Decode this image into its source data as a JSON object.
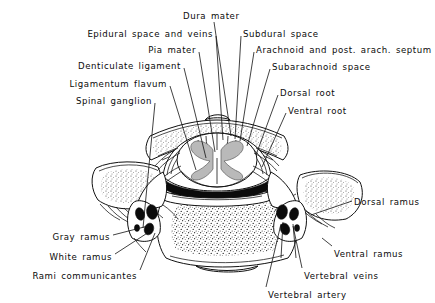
{
  "figure": {
    "style": "line-drawing",
    "ink_color": "#111111",
    "background_color": "#ffffff"
  },
  "labels": [
    {
      "id": "dura-mater",
      "text": "Dura mater",
      "align": "left",
      "x": 183,
      "y": 11,
      "leader": [
        [
          214,
          22
        ],
        [
          231,
          136
        ]
      ]
    },
    {
      "id": "epidural-space",
      "text": "Epidural space and veins",
      "align": "right",
      "x": 213,
      "y": 29,
      "leader": [
        [
          216,
          36
        ],
        [
          223,
          140
        ]
      ]
    },
    {
      "id": "pia-mater",
      "text": "Pia mater",
      "align": "right",
      "x": 196,
      "y": 45,
      "leader": [
        [
          199,
          52
        ],
        [
          215,
          152
        ]
      ]
    },
    {
      "id": "denticulate",
      "text": "Denticulate ligament",
      "align": "right",
      "x": 181,
      "y": 61,
      "leader": [
        [
          184,
          68
        ],
        [
          206,
          158
        ]
      ]
    },
    {
      "id": "ligamentum-flavum",
      "text": "Ligamentum flavum",
      "align": "right",
      "x": 167,
      "y": 79,
      "leader": [
        [
          170,
          86
        ],
        [
          196,
          170
        ]
      ]
    },
    {
      "id": "spinal-ganglion",
      "text": "Spinal ganglion",
      "align": "right",
      "x": 152,
      "y": 96,
      "leader": [
        [
          155,
          103
        ],
        [
          143,
          228
        ]
      ]
    },
    {
      "id": "subdural-space",
      "text": "Subdural space",
      "align": "left",
      "x": 243,
      "y": 29,
      "leader": [
        [
          241,
          36
        ],
        [
          235,
          139
        ]
      ]
    },
    {
      "id": "arachnoid",
      "text": "Arachnoid and post. arach. septum",
      "align": "left",
      "x": 256,
      "y": 45,
      "leader": [
        [
          254,
          52
        ],
        [
          240,
          141
        ]
      ]
    },
    {
      "id": "subarachnoid",
      "text": "Subarachnoid space",
      "align": "left",
      "x": 272,
      "y": 62,
      "leader": [
        [
          270,
          69
        ],
        [
          247,
          146
        ]
      ]
    },
    {
      "id": "dorsal-root",
      "text": "Dorsal root",
      "align": "left",
      "x": 280,
      "y": 88,
      "leader": [
        [
          278,
          95
        ],
        [
          256,
          155
        ]
      ]
    },
    {
      "id": "ventral-root",
      "text": "Ventral root",
      "align": "left",
      "x": 288,
      "y": 106,
      "leader": [
        [
          286,
          113
        ],
        [
          262,
          167
        ]
      ]
    },
    {
      "id": "dorsal-ramus",
      "text": "Dorsal ramus",
      "align": "left",
      "x": 354,
      "y": 197,
      "leader": [
        [
          352,
          201
        ],
        [
          311,
          215
        ]
      ]
    },
    {
      "id": "ventral-ramus",
      "text": "Ventral ramus",
      "align": "left",
      "x": 334,
      "y": 249,
      "leader": [
        [
          332,
          246
        ],
        [
          322,
          238
        ]
      ]
    },
    {
      "id": "vertebral-veins",
      "text": "Vertebral veins",
      "align": "left",
      "x": 304,
      "y": 271,
      "leader": [
        [
          302,
          268
        ],
        [
          293,
          226
        ]
      ]
    },
    {
      "id": "vertebral-artery",
      "text": "Vertebral artery",
      "align": "left",
      "x": 268,
      "y": 290,
      "leader": [
        [
          266,
          287
        ],
        [
          281,
          224
        ]
      ]
    },
    {
      "id": "gray-ramus",
      "text": "Gray ramus",
      "align": "right",
      "x": 110,
      "y": 232,
      "leader": [
        [
          113,
          235
        ],
        [
          148,
          226
        ]
      ]
    },
    {
      "id": "white-ramus",
      "text": "White ramus",
      "align": "right",
      "x": 112,
      "y": 252,
      "leader": [
        [
          115,
          254
        ],
        [
          152,
          230
        ]
      ]
    },
    {
      "id": "rami-communicantes",
      "text": "Rami communicantes",
      "align": "right",
      "x": 137,
      "y": 271,
      "leader": [
        [
          140,
          270
        ],
        [
          155,
          233
        ]
      ]
    }
  ],
  "anatomy": {
    "parts": [
      "spinal cord",
      "gray matter",
      "dura mater",
      "arachnoid",
      "pia mater",
      "subarachnoid space",
      "epidural space",
      "vertebral body",
      "transverse process",
      "lamina",
      "spinal ganglion",
      "dorsal root",
      "ventral root",
      "vertebral artery",
      "vertebral veins"
    ]
  }
}
